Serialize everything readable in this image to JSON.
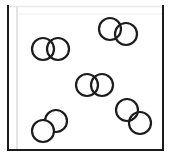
{
  "scene": {
    "title": "Gas particle diagram",
    "description": "Five diatomic molecules inside a rectangular container",
    "width": 169,
    "height": 157,
    "background_color": "#ffffff"
  },
  "container": {
    "name": "container-box",
    "shape": "rectangle",
    "x": 8,
    "y": 6,
    "width": 155,
    "height": 144,
    "fill": "#ffffff",
    "stroke_dark": "#1a1a1a",
    "stroke_light": "#e8e8e8",
    "stroke_width": 2,
    "inner_stroke": "#d8d8d8",
    "inner_offset": 9
  },
  "particles": {
    "radius": 11,
    "stroke": "#1c1c1c",
    "stroke_width": 2.2,
    "fill": "#ffffff",
    "count_molecules": 5,
    "count_atoms": 10,
    "molecules": [
      {
        "id": "molecule-1",
        "label": "top-right molecule",
        "orientation": "diagonal-down-right",
        "atoms": [
          {
            "id": "atom-1a",
            "cx": 110,
            "cy": 29,
            "r": 11
          },
          {
            "id": "atom-1b",
            "cx": 126,
            "cy": 34,
            "r": 11
          }
        ]
      },
      {
        "id": "molecule-2",
        "label": "upper-left molecule",
        "orientation": "horizontal",
        "atoms": [
          {
            "id": "atom-2a",
            "cx": 43,
            "cy": 49,
            "r": 11
          },
          {
            "id": "atom-2b",
            "cx": 58,
            "cy": 49,
            "r": 11
          }
        ]
      },
      {
        "id": "molecule-3",
        "label": "center molecule",
        "orientation": "horizontal",
        "atoms": [
          {
            "id": "atom-3a",
            "cx": 87,
            "cy": 85,
            "r": 11
          },
          {
            "id": "atom-3b",
            "cx": 102,
            "cy": 85,
            "r": 11
          }
        ]
      },
      {
        "id": "molecule-4",
        "label": "lower-right molecule",
        "orientation": "diagonal-down-right",
        "atoms": [
          {
            "id": "atom-4a",
            "cx": 127,
            "cy": 110,
            "r": 11
          },
          {
            "id": "atom-4b",
            "cx": 140,
            "cy": 123,
            "r": 11
          }
        ]
      },
      {
        "id": "molecule-5",
        "label": "lower-left molecule",
        "orientation": "diagonal-up-right",
        "atoms": [
          {
            "id": "atom-5a",
            "cx": 43,
            "cy": 131,
            "r": 11
          },
          {
            "id": "atom-5b",
            "cx": 56,
            "cy": 121,
            "r": 11
          }
        ]
      }
    ]
  }
}
